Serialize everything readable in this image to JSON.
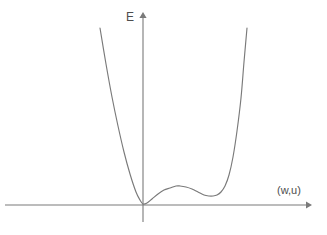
{
  "figure": {
    "background_color": "#ffffff",
    "line_color": "#7a7a7a",
    "text_color": "#4d4d4d"
  },
  "axes": {
    "vertical": {
      "label": "E",
      "label_name": "energy-axis-label",
      "arrow_direction": "up",
      "x": 143,
      "y_top": 13,
      "y_bottom": 222
    },
    "horizontal": {
      "label": "(w,u)",
      "label_name": "order-parameter-axis-label",
      "arrow_direction": "right",
      "y": 205,
      "x_left": 5,
      "x_right": 310
    }
  },
  "chart_data": {
    "type": "line",
    "title": "",
    "subtitle": "",
    "xlabel": "(w,u)",
    "ylabel": "E",
    "grid": false,
    "legend": null,
    "legend_position": "none",
    "xlim": [
      5,
      310
    ],
    "ylim": [
      222,
      13
    ],
    "axis_units": "pixels (image coordinates, y inverted)",
    "series": [
      {
        "name": "potential-energy-curve",
        "color": "#7a7a7a",
        "x": [
          100,
          106,
          112,
          118,
          124,
          130,
          136,
          140,
          143,
          147,
          152,
          158,
          164,
          170,
          176,
          180,
          186,
          192,
          198,
          204,
          209,
          213,
          217,
          221,
          225,
          229,
          233,
          237,
          241,
          244,
          247
        ],
        "y": [
          28,
          64,
          97,
          126,
          152,
          174,
          192,
          200,
          204,
          203,
          199,
          194,
          190,
          188,
          186,
          186,
          187,
          189,
          192,
          195,
          196,
          196,
          195,
          192,
          186,
          175,
          157,
          131,
          98,
          62,
          28
        ]
      }
    ],
    "critical_points": [
      {
        "name": "global-minimum",
        "label": "global minimum at origin",
        "x": 143,
        "y": 204
      },
      {
        "name": "local-maximum",
        "label": "barrier hump",
        "x": 180,
        "y": 186
      },
      {
        "name": "local-minimum",
        "label": "shallow secondary minimum",
        "x": 213,
        "y": 196
      }
    ],
    "annotations": []
  }
}
